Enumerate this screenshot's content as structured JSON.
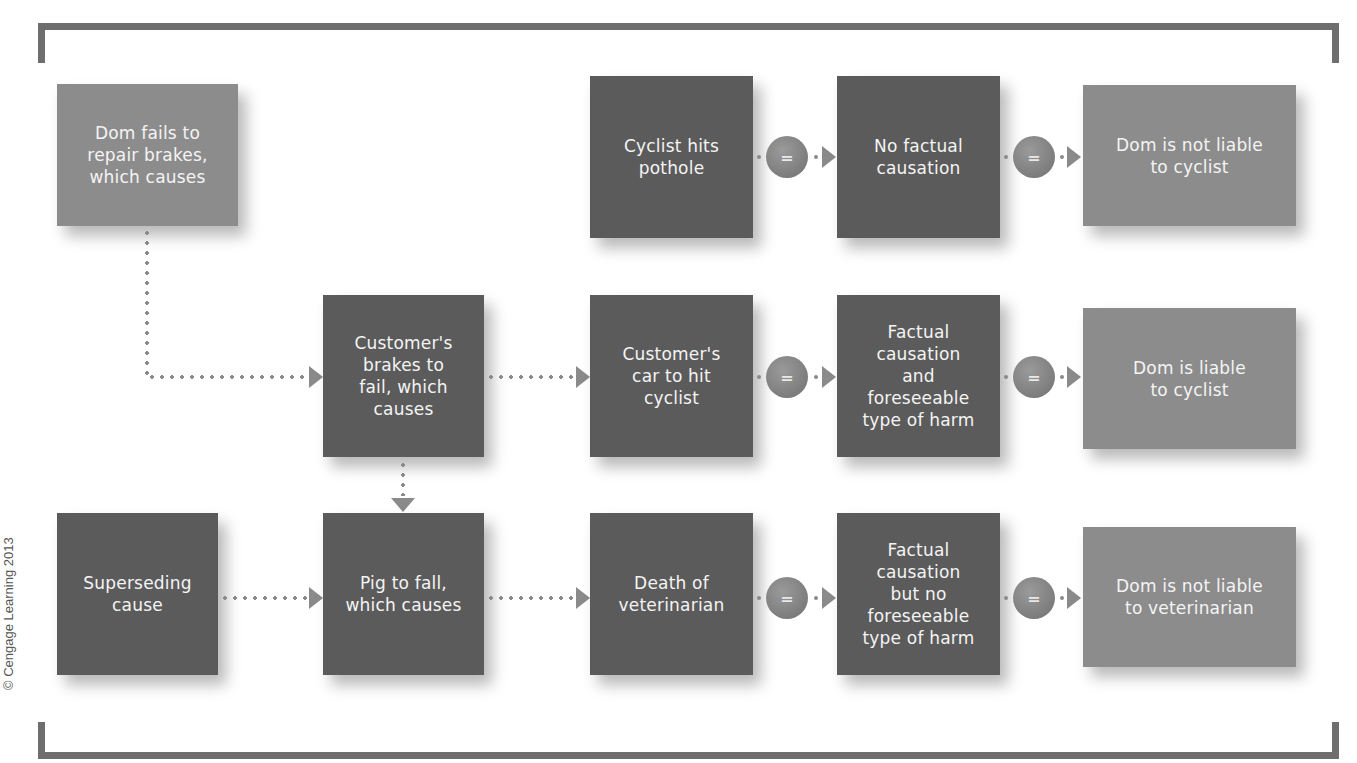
{
  "diagram": {
    "copyright": "© Cengage Learning 2013",
    "equals_symbol": "=",
    "colors": {
      "dark_box": "#5b5b5b",
      "light_box": "#8c8c8c",
      "connector": "#8a8a8a",
      "bracket": "#6e6e6e"
    },
    "start": {
      "label": "Dom fails to\nrepair brakes,\nwhich causes"
    },
    "row1": {
      "event": "Cyclist hits\npothole",
      "causation": "No factual\ncausation",
      "result": "Dom is not liable\nto cyclist"
    },
    "row2": {
      "cause": "Customer's\nbrakes to\nfail, which\ncauses",
      "event": "Customer's\ncar to hit\ncyclist",
      "causation": "Factual\ncausation\nand\nforeseeable\ntype of harm",
      "result": "Dom is liable\nto cyclist"
    },
    "row3": {
      "superseding": "Superseding\ncause",
      "cause": "Pig to fall,\nwhich causes",
      "event": "Death of\nveterinarian",
      "causation": "Factual\ncausation\nbut no\nforeseeable\ntype of harm",
      "result": "Dom is not liable\nto veterinarian"
    }
  }
}
